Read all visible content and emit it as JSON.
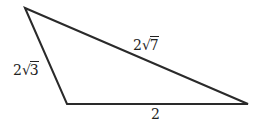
{
  "diagram": {
    "type": "triangle",
    "stroke_color": "#2a2a2a",
    "stroke_width": 2,
    "vertices": {
      "top": {
        "x": 25,
        "y": 8
      },
      "bottom_left": {
        "x": 67,
        "y": 104
      },
      "bottom_right": {
        "x": 248,
        "y": 104
      }
    },
    "sides": {
      "left": {
        "coefficient": "2",
        "radical_symbol": "√",
        "radicand": "3",
        "text": "2√3"
      },
      "hypotenuse": {
        "coefficient": "2",
        "radical_symbol": "√",
        "radicand": "7",
        "text": "2√7"
      },
      "base": {
        "text": "2"
      }
    }
  }
}
